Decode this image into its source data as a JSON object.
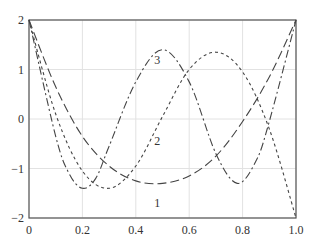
{
  "chart_data": {
    "type": "line",
    "title": "",
    "xlabel": "",
    "ylabel": "",
    "xlim": [
      0,
      1.0
    ],
    "ylim": [
      -2,
      2
    ],
    "grid": true,
    "x_ticks": [
      "0",
      "0.2",
      "0.4",
      "0.6",
      "0.8",
      "1.0"
    ],
    "y_ticks": [
      "-2",
      "-1",
      "0",
      "1",
      "2"
    ],
    "series": [
      {
        "name": "1",
        "style": "long-dash",
        "x": [
          0,
          0.1,
          0.2,
          0.3,
          0.4,
          0.5,
          0.6,
          0.7,
          0.8,
          0.9,
          1.0
        ],
        "y": [
          2,
          0.65,
          -0.35,
          -0.95,
          -1.25,
          -1.3,
          -1.15,
          -0.75,
          -0.05,
          0.85,
          2
        ]
      },
      {
        "name": "2",
        "style": "short-dash",
        "x": [
          0,
          0.1,
          0.2,
          0.3,
          0.4,
          0.5,
          0.6,
          0.7,
          0.8,
          0.9,
          1.0
        ],
        "y": [
          2,
          0.1,
          -1.05,
          -1.4,
          -0.95,
          0.05,
          1.0,
          1.35,
          0.95,
          -0.2,
          -2
        ]
      },
      {
        "name": "3",
        "style": "dash-dot",
        "x": [
          0,
          0.1,
          0.15,
          0.2,
          0.25,
          0.3,
          0.4,
          0.5,
          0.6,
          0.7,
          0.78,
          0.85,
          0.9,
          1.0
        ],
        "y": [
          2,
          -0.35,
          -1.1,
          -1.4,
          -1.2,
          -0.55,
          0.75,
          1.4,
          0.75,
          -0.7,
          -1.3,
          -0.85,
          -0.05,
          2
        ]
      }
    ],
    "annotations": [
      {
        "text": "1",
        "x": 0.48,
        "y": -1.7
      },
      {
        "text": "2",
        "x": 0.48,
        "y": -0.45
      },
      {
        "text": "3",
        "x": 0.48,
        "y": 1.2
      }
    ]
  }
}
